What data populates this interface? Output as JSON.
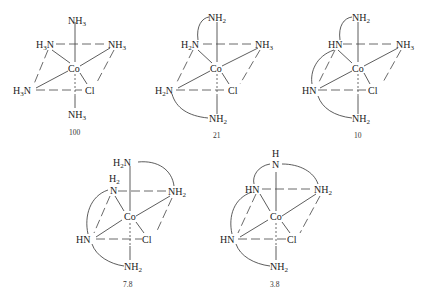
{
  "figure": {
    "type": "octahedral cobalt(III) chloro-amine complexes",
    "structures": [
      {
        "id": "s1",
        "caption": "100",
        "center": "Co",
        "ligands": {
          "top": "NH3",
          "upper_left": "H3N",
          "upper_right": "NH3",
          "lower_left": "H3N",
          "lower_right": "Cl",
          "bottom": "NH3"
        }
      },
      {
        "id": "s2",
        "caption": "21",
        "center": "Co",
        "ligands": {
          "top": "NH2",
          "upper_left": "H2N",
          "upper_right": "NH3",
          "lower_left": "H2N",
          "lower_right": "Cl",
          "bottom": "NH2"
        }
      },
      {
        "id": "s3",
        "caption": "10",
        "center": "Co",
        "ligands": {
          "top": "NH2",
          "upper_left": "HN",
          "upper_right": "NH3",
          "lower_left": "HN",
          "lower_right": "Cl",
          "bottom": "NH2"
        }
      },
      {
        "id": "s4",
        "caption": "7.8",
        "center": "Co",
        "ligands": {
          "top": "H2N",
          "upper_left": "N",
          "upper_left_h": "H2",
          "upper_right": "NH2",
          "lower_left": "HN",
          "lower_right": "Cl",
          "bottom": "NH2"
        }
      },
      {
        "id": "s5",
        "caption": "3.8",
        "center": "Co",
        "ligands": {
          "top": "N",
          "top_h": "H",
          "upper_left": "HN",
          "upper_right": "NH2",
          "lower_left": "HN",
          "lower_right": "Cl",
          "bottom": "NH2"
        }
      }
    ]
  }
}
